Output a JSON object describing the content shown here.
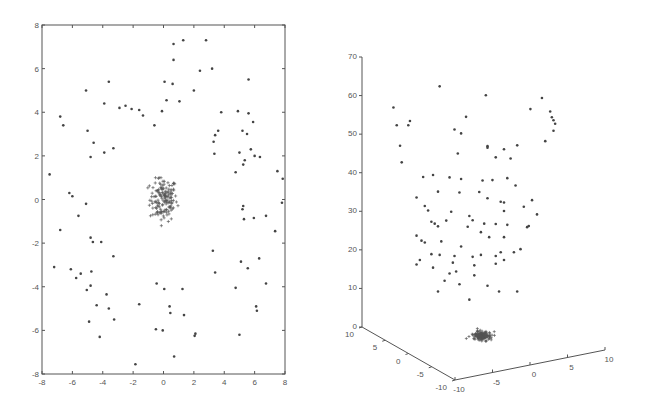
{
  "chart_data": [
    {
      "type": "scatter",
      "title": "",
      "xlabel": "",
      "ylabel": "",
      "xlim": [
        -8,
        8
      ],
      "ylim": [
        -8,
        8
      ],
      "xticks": [
        -8,
        -6,
        -4,
        -2,
        0,
        2,
        4,
        6,
        8
      ],
      "yticks": [
        -8,
        -6,
        -4,
        -2,
        0,
        2,
        4,
        6,
        8
      ],
      "xtick_labels": [
        "-8",
        "-6",
        "-4",
        "-2",
        "0",
        "2",
        "4",
        "6",
        "8"
      ],
      "ytick_labels": [
        "-8",
        "-6",
        "-4",
        "-2",
        "0",
        "2",
        "4",
        "6",
        "8"
      ],
      "grid": false,
      "legend": "none",
      "series": [
        {
          "name": "scattered points",
          "marker": "dot",
          "points": [
            [
              0.66,
              7.13
            ],
            [
              1.3,
              7.3
            ],
            [
              2.8,
              7.3
            ],
            [
              0.66,
              6.4
            ],
            [
              2.4,
              5.9
            ],
            [
              3.2,
              6.0
            ],
            [
              -5.1,
              5.0
            ],
            [
              -3.6,
              5.4
            ],
            [
              0.07,
              5.4
            ],
            [
              0.6,
              5.3
            ],
            [
              2.0,
              5.0
            ],
            [
              5.6,
              5.5
            ],
            [
              -2.5,
              4.3
            ],
            [
              -1.6,
              4.1
            ],
            [
              -3.9,
              4.4
            ],
            [
              -6.8,
              3.8
            ],
            [
              -6.6,
              3.4
            ],
            [
              -5.0,
              3.15
            ],
            [
              -4.6,
              2.6
            ],
            [
              -3.9,
              2.15
            ],
            [
              -4.8,
              1.95
            ],
            [
              -3.3,
              2.35
            ],
            [
              -2.9,
              4.2
            ],
            [
              -2.1,
              4.15
            ],
            [
              -1.35,
              3.85
            ],
            [
              -0.6,
              3.4
            ],
            [
              -0.1,
              4.05
            ],
            [
              0.2,
              4.55
            ],
            [
              1.05,
              4.5
            ],
            [
              4.9,
              4.05
            ],
            [
              3.8,
              4.0
            ],
            [
              5.6,
              3.95
            ],
            [
              5.9,
              3.55
            ],
            [
              3.4,
              2.95
            ],
            [
              3.6,
              3.15
            ],
            [
              3.3,
              2.65
            ],
            [
              3.35,
              2.1
            ],
            [
              5.2,
              3.15
            ],
            [
              5.5,
              3.0
            ],
            [
              5.0,
              2.15
            ],
            [
              5.75,
              2.3
            ],
            [
              5.35,
              1.8
            ],
            [
              6.0,
              2.0
            ],
            [
              6.35,
              1.95
            ],
            [
              4.75,
              1.25
            ],
            [
              5.25,
              1.6
            ],
            [
              7.5,
              1.3
            ],
            [
              7.85,
              0.95
            ],
            [
              -7.5,
              1.15
            ],
            [
              -6.2,
              0.3
            ],
            [
              -6.0,
              0.15
            ],
            [
              -5.1,
              -0.2
            ],
            [
              -5.6,
              -0.75
            ],
            [
              -6.8,
              -1.4
            ],
            [
              -4.8,
              -1.75
            ],
            [
              -4.65,
              -1.95
            ],
            [
              -4.1,
              -1.95
            ],
            [
              -3.3,
              -2.6
            ],
            [
              -7.2,
              -3.1
            ],
            [
              -6.1,
              -3.2
            ],
            [
              -5.45,
              -3.4
            ],
            [
              -5.75,
              -3.6
            ],
            [
              -4.75,
              -3.3
            ],
            [
              -5.05,
              -4.15
            ],
            [
              -4.8,
              -3.95
            ],
            [
              -3.75,
              -4.35
            ],
            [
              -4.4,
              -4.85
            ],
            [
              -3.6,
              -5.0
            ],
            [
              -3.25,
              -5.5
            ],
            [
              -4.9,
              -5.6
            ],
            [
              -4.2,
              -6.3
            ],
            [
              -1.85,
              -7.55
            ],
            [
              -1.6,
              -4.8
            ],
            [
              -0.45,
              -3.85
            ],
            [
              -0.5,
              -5.95
            ],
            [
              0.7,
              -7.2
            ],
            [
              0.45,
              -5.2
            ],
            [
              1.25,
              -4.1
            ],
            [
              1.35,
              -5.3
            ],
            [
              2.1,
              -6.15
            ],
            [
              2.05,
              -6.25
            ],
            [
              3.25,
              -2.35
            ],
            [
              3.4,
              -3.35
            ],
            [
              4.75,
              -4.05
            ],
            [
              5.1,
              -2.85
            ],
            [
              5.55,
              -3.15
            ],
            [
              6.3,
              -2.7
            ],
            [
              6.75,
              -3.85
            ],
            [
              5.25,
              -0.3
            ],
            [
              5.2,
              -0.45
            ],
            [
              5.3,
              -0.9
            ],
            [
              5.95,
              -0.85
            ],
            [
              6.75,
              -0.75
            ],
            [
              7.8,
              -0.15
            ],
            [
              7.35,
              -1.45
            ],
            [
              6.1,
              -4.9
            ],
            [
              6.15,
              -5.1
            ],
            [
              5.0,
              -6.2
            ],
            [
              -0.05,
              -6.0
            ],
            [
              0.05,
              -4.1
            ],
            [
              0.4,
              -4.9
            ]
          ]
        },
        {
          "name": "dense cluster",
          "marker": "plus",
          "center": [
            0,
            0
          ],
          "approx_extent": {
            "x": [
              -1.1,
              1.2
            ],
            "y": [
              -1.2,
              1.0
            ]
          },
          "approx_count": 150
        }
      ]
    },
    {
      "type": "scatter",
      "subtype": "3d",
      "title": "",
      "xlim": [
        -10,
        10
      ],
      "ylim": [
        -10,
        10
      ],
      "zlim": [
        0,
        70
      ],
      "xticks": [
        -10,
        -5,
        0,
        5,
        10
      ],
      "yticks": [
        -10,
        -5,
        0,
        5,
        10
      ],
      "zticks": [
        0,
        10,
        20,
        30,
        40,
        50,
        60,
        70
      ],
      "xtick_labels": [
        "-10",
        "-5",
        "0",
        "5",
        "10"
      ],
      "ytick_labels": [
        "-10",
        "-5",
        "0",
        "5",
        "10"
      ],
      "ztick_labels": [
        "0",
        "10",
        "20",
        "30",
        "40",
        "50",
        "60",
        "70"
      ],
      "grid": false,
      "legend": "none",
      "series": [
        {
          "name": "scattered points (screen-projected x, height z)",
          "marker": "dot",
          "points_screen_relative": [
            [
              0.21,
              65.5
            ],
            [
              0.49,
              63.2
            ],
            [
              -0.07,
              60
            ],
            [
              0.37,
              57.6
            ],
            [
              0.03,
              56.5
            ],
            [
              -0.05,
              55.4
            ],
            [
              0.02,
              55.4
            ],
            [
              0.3,
              54.3
            ],
            [
              0.34,
              53.3
            ],
            [
              0.83,
              62.5
            ],
            [
              0.76,
              59.6
            ],
            [
              0.88,
              59.0
            ],
            [
              0.89,
              57.5
            ],
            [
              0.9,
              56.7
            ],
            [
              0.91,
              55.8
            ],
            [
              0.9,
              54.0
            ],
            [
              0.85,
              51.3
            ],
            [
              0.5,
              50.0
            ],
            [
              0.5,
              49.6
            ],
            [
              0.32,
              48.1
            ],
            [
              0.68,
              50.2
            ],
            [
              0.6,
              49.2
            ],
            [
              0.55,
              47.1
            ],
            [
              0.64,
              46.8
            ],
            [
              -0.03,
              50.1
            ],
            [
              -0.02,
              45.8
            ],
            [
              0.11,
              42.0
            ],
            [
              0.17,
              42.5
            ],
            [
              0.27,
              41.9
            ],
            [
              0.34,
              41.5
            ],
            [
              0.47,
              41.1
            ],
            [
              0.53,
              41.2
            ],
            [
              0.62,
              41.7
            ],
            [
              0.67,
              39.8
            ],
            [
              0.2,
              38.2
            ],
            [
              0.33,
              38.0
            ],
            [
              0.45,
              38.1
            ],
            [
              0.5,
              36.5
            ],
            [
              0.07,
              36.7
            ],
            [
              0.72,
              34.3
            ],
            [
              0.77,
              36.0
            ],
            [
              0.6,
              35.4
            ],
            [
              0.58,
              35.6
            ],
            [
              0.6,
              33.2
            ],
            [
              0.8,
              32.3
            ],
            [
              0.48,
              29.9
            ],
            [
              0.62,
              29.6
            ],
            [
              0.75,
              29.3
            ],
            [
              0.74,
              29.0
            ],
            [
              0.12,
              34.5
            ],
            [
              0.14,
              33.3
            ],
            [
              0.28,
              33.0
            ],
            [
              0.39,
              31.9
            ],
            [
              0.41,
              30.8
            ],
            [
              0.55,
              29.8
            ],
            [
              0.25,
              30.7
            ],
            [
              0.16,
              30.4
            ],
            [
              0.18,
              29.9
            ],
            [
              0.2,
              29.2
            ],
            [
              0.38,
              29.1
            ],
            [
              0.46,
              27.7
            ],
            [
              0.51,
              26.4
            ],
            [
              0.6,
              26.4
            ],
            [
              0.07,
              26.8
            ],
            [
              0.1,
              25.5
            ],
            [
              0.12,
              25.0
            ],
            [
              0.22,
              25.3
            ],
            [
              0.34,
              24.0
            ],
            [
              0.16,
              22.0
            ],
            [
              0.21,
              21.8
            ],
            [
              0.3,
              21.5
            ],
            [
              0.41,
              21.3
            ],
            [
              0.46,
              21.8
            ],
            [
              0.55,
              21.5
            ],
            [
              0.58,
              22.5
            ],
            [
              0.09,
              20.5
            ],
            [
              0.07,
              19.3
            ],
            [
              0.17,
              18.5
            ],
            [
              0.29,
              19.8
            ],
            [
              0.31,
              17.5
            ],
            [
              0.27,
              17.0
            ],
            [
              0.42,
              19.1
            ],
            [
              0.55,
              19.5
            ],
            [
              0.6,
              20.5
            ],
            [
              0.66,
              22.5
            ],
            [
              0.7,
              23.3
            ],
            [
              0.24,
              15.1
            ],
            [
              0.33,
              14.2
            ],
            [
              0.42,
              16.5
            ],
            [
              0.5,
              13.8
            ],
            [
              0.57,
              12.3
            ],
            [
              0.68,
              12.3
            ],
            [
              0.39,
              10.2
            ],
            [
              0.2,
              12.3
            ]
          ]
        },
        {
          "name": "dense cluster",
          "marker": "plus",
          "center": [
            0,
            0,
            0
          ],
          "approx_count": 150
        }
      ]
    }
  ]
}
